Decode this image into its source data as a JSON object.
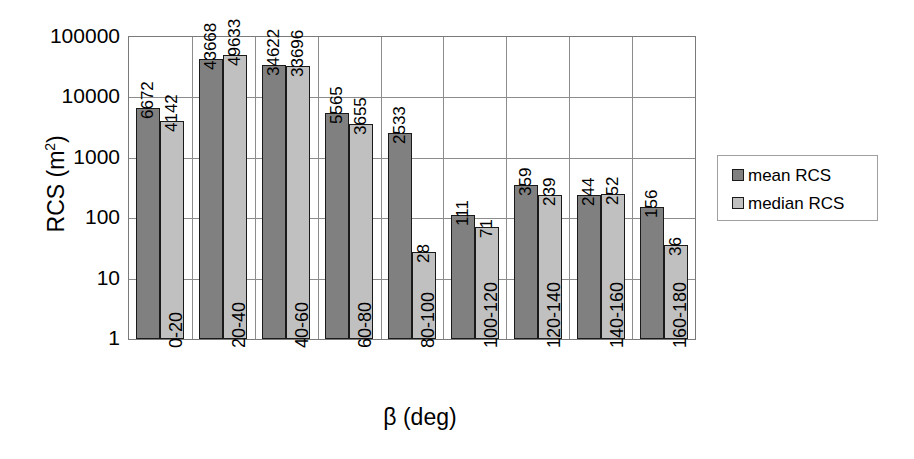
{
  "chart_data": {
    "type": "bar",
    "title": "",
    "xlabel": "β (deg)",
    "ylabel": "RCS (m²)",
    "ylabel_base": "RCS (m",
    "ylabel_sup": "2",
    "ylabel_tail": ")",
    "yscale": "log",
    "ylim": [
      1,
      100000
    ],
    "ytick_labels": [
      "100000",
      "10000",
      "1000",
      "100",
      "10",
      "1"
    ],
    "ytick_values": [
      100000,
      10000,
      1000,
      100,
      10,
      1
    ],
    "grid": true,
    "legend_position": "right",
    "categories": [
      "0-20",
      "20-40",
      "40-60",
      "60-80",
      "80-100",
      "100-120",
      "120-140",
      "140-160",
      "160-180"
    ],
    "series": [
      {
        "name": "mean RCS",
        "color": "#808080",
        "values": [
          6672,
          43668,
          34622,
          5565,
          2533,
          111,
          359,
          244,
          156
        ]
      },
      {
        "name": "median RCS",
        "color": "#c0c0c0",
        "values": [
          4142,
          49633,
          33696,
          3655,
          28,
          71,
          239,
          252,
          36
        ]
      }
    ],
    "data_labels": [
      {
        "series": "mean RCS",
        "category": "0-20",
        "text": "6672"
      },
      {
        "series": "median RCS",
        "category": "0-20",
        "text": "4142"
      },
      {
        "series": "mean RCS",
        "category": "20-40",
        "text": "43668"
      },
      {
        "series": "median RCS",
        "category": "20-40",
        "text": "49633"
      },
      {
        "series": "mean RCS",
        "category": "40-60",
        "text": "34622"
      },
      {
        "series": "median RCS",
        "category": "40-60",
        "text": "33696"
      },
      {
        "series": "mean RCS",
        "category": "60-80",
        "text": "5565"
      },
      {
        "series": "median RCS",
        "category": "60-80",
        "text": "3655"
      },
      {
        "series": "mean RCS",
        "category": "80-100",
        "text": "2533"
      },
      {
        "series": "median RCS",
        "category": "80-100",
        "text": "28"
      },
      {
        "series": "mean RCS",
        "category": "100-120",
        "text": "111"
      },
      {
        "series": "median RCS",
        "category": "100-120",
        "text": "71"
      },
      {
        "series": "mean RCS",
        "category": "120-140",
        "text": "359"
      },
      {
        "series": "median RCS",
        "category": "120-140",
        "text": "239"
      },
      {
        "series": "mean RCS",
        "category": "140-160",
        "text": "244"
      },
      {
        "series": "median RCS",
        "category": "140-160",
        "text": "252"
      },
      {
        "series": "mean RCS",
        "category": "160-180",
        "text": "156"
      },
      {
        "series": "median RCS",
        "category": "160-180",
        "text": "36"
      }
    ]
  },
  "legend": {
    "entries": [
      {
        "label": "mean RCS",
        "color": "#808080"
      },
      {
        "label": "median RCS",
        "color": "#c0c0c0"
      }
    ]
  },
  "colors": {
    "mean": "#808080",
    "median": "#c0c0c0",
    "grid": "#8c8c8c",
    "axis": "#7a7a7a",
    "bar_outline": "#1a1a1a",
    "text": "#000000",
    "background": "#ffffff"
  }
}
